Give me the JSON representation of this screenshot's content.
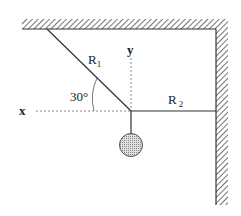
{
  "diagram": {
    "labels": {
      "r1": "R",
      "r1_sub": "1",
      "r2": "R",
      "r2_sub": "2",
      "angle": "30°",
      "x_axis": "x",
      "y_axis": "y"
    },
    "colors": {
      "line": "#333333",
      "hatch": "#444444",
      "ball_fill": "#bdbdbd",
      "dashed": "#888888"
    },
    "angle_deg": 30
  }
}
